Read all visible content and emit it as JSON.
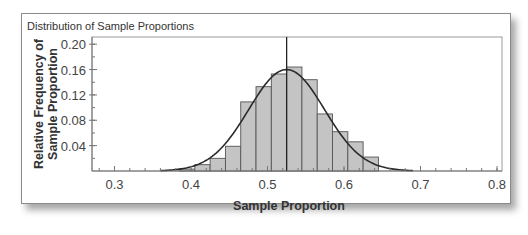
{
  "chart_data": {
    "type": "bar",
    "subtype": "histogram_with_normal_curve",
    "title": "Distribution of Sample Proportions",
    "xlabel": "Sample Proportion",
    "ylabel": "Relative Frequency of Sample Proportion",
    "ylabel_lines": [
      "Relative Frequency of",
      "Sample Proportion"
    ],
    "xlim": [
      0.27,
      0.81
    ],
    "ylim": [
      0,
      0.21
    ],
    "x_ticks": [
      0.3,
      0.4,
      0.5,
      0.6,
      0.7,
      0.8
    ],
    "x_tick_labels": [
      "0.3",
      "0.4",
      "0.5",
      "0.6",
      "0.7",
      "0.8"
    ],
    "x_minor_step": 0.02,
    "y_ticks": [
      0.04,
      0.08,
      0.12,
      0.16,
      0.2
    ],
    "y_tick_labels": [
      "0.04",
      "0.08",
      "0.12",
      "0.16",
      "0.20"
    ],
    "y_minor_step": 0.02,
    "grid": false,
    "legend": null,
    "bin_width": 0.02,
    "bins": [
      {
        "start": 0.385,
        "end": 0.405,
        "value": 0.003
      },
      {
        "start": 0.405,
        "end": 0.425,
        "value": 0.01
      },
      {
        "start": 0.425,
        "end": 0.445,
        "value": 0.02
      },
      {
        "start": 0.445,
        "end": 0.465,
        "value": 0.039
      },
      {
        "start": 0.465,
        "end": 0.485,
        "value": 0.109
      },
      {
        "start": 0.485,
        "end": 0.505,
        "value": 0.133
      },
      {
        "start": 0.505,
        "end": 0.525,
        "value": 0.153
      },
      {
        "start": 0.525,
        "end": 0.545,
        "value": 0.164
      },
      {
        "start": 0.545,
        "end": 0.565,
        "value": 0.144
      },
      {
        "start": 0.565,
        "end": 0.585,
        "value": 0.09
      },
      {
        "start": 0.585,
        "end": 0.605,
        "value": 0.062
      },
      {
        "start": 0.605,
        "end": 0.625,
        "value": 0.046
      },
      {
        "start": 0.625,
        "end": 0.645,
        "value": 0.022
      }
    ],
    "normal_curve": {
      "mean": 0.525,
      "sd": 0.0495,
      "peak": 0.16,
      "x_range": [
        0.36,
        0.69
      ]
    },
    "reference_line": {
      "x": 0.525,
      "label": "mean"
    },
    "colors": {
      "bar_fill": "#c4c4c4",
      "bar_edge": "#555555",
      "curve": "#2a2a2a",
      "axis": "#777777",
      "frame": "#8a8a8a"
    }
  }
}
